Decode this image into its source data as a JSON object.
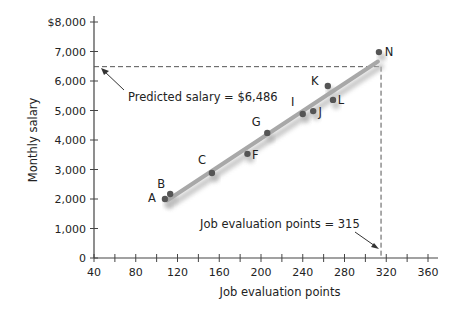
{
  "chart_data": {
    "type": "scatter",
    "title": "",
    "xlabel": "Job evaluation points",
    "ylabel": "Monthly salary",
    "xlim": [
      40,
      360
    ],
    "ylim": [
      0,
      8000
    ],
    "x_ticks": [
      40,
      80,
      120,
      160,
      200,
      240,
      280,
      320,
      360
    ],
    "x_minor_ticks": [
      60,
      100,
      140,
      180,
      220,
      260,
      300,
      340
    ],
    "y_ticks": [
      0,
      1000,
      2000,
      3000,
      4000,
      5000,
      6000,
      7000,
      8000
    ],
    "y_tick_labels": [
      "0",
      "1,000",
      "2,000",
      "3,000",
      "4,000",
      "5,000",
      "6,000",
      "7,000",
      "$8,000"
    ],
    "x_tick_labels": [
      "40",
      "80",
      "120",
      "160",
      "200",
      "240",
      "280",
      "320",
      "360"
    ],
    "grid": false,
    "legend": null,
    "points": [
      {
        "label": "A",
        "x": 108,
        "y": 2000
      },
      {
        "label": "B",
        "x": 113,
        "y": 2170
      },
      {
        "label": "C",
        "x": 153,
        "y": 2880
      },
      {
        "label": "F",
        "x": 187,
        "y": 3530
      },
      {
        "label": "G",
        "x": 206,
        "y": 4240
      },
      {
        "label": "I",
        "x": 240,
        "y": 4880
      },
      {
        "label": "J",
        "x": 250,
        "y": 4980
      },
      {
        "label": "K",
        "x": 264,
        "y": 5830
      },
      {
        "label": "L",
        "x": 269,
        "y": 5360
      },
      {
        "label": "N",
        "x": 313,
        "y": 6980
      }
    ],
    "regression_line": {
      "x_start": 110,
      "y_start": 1950,
      "x_end": 312,
      "y_end": 6660
    },
    "reference": {
      "x": 315,
      "y": 6486
    },
    "annotations": [
      {
        "text": "Predicted salary = $6,486"
      },
      {
        "text": "Job evaluation points = 315"
      }
    ]
  }
}
